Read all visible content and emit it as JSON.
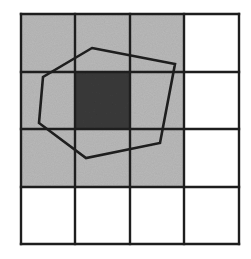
{
  "diagram": {
    "title": "",
    "grid": {
      "rows": 4,
      "cols": 4,
      "x_lines": [
        21,
        75,
        130,
        184,
        239
      ],
      "y_lines": [
        14,
        72,
        129,
        187,
        244
      ],
      "line_color": "#1e1e1e"
    },
    "cells": [
      {
        "row": 0,
        "col": 0,
        "fill": "light-gray"
      },
      {
        "row": 0,
        "col": 1,
        "fill": "light-gray"
      },
      {
        "row": 0,
        "col": 2,
        "fill": "light-gray"
      },
      {
        "row": 0,
        "col": 3,
        "fill": "white"
      },
      {
        "row": 1,
        "col": 0,
        "fill": "light-gray"
      },
      {
        "row": 1,
        "col": 1,
        "fill": "dark-gray"
      },
      {
        "row": 1,
        "col": 2,
        "fill": "light-gray"
      },
      {
        "row": 1,
        "col": 3,
        "fill": "white"
      },
      {
        "row": 2,
        "col": 0,
        "fill": "light-gray"
      },
      {
        "row": 2,
        "col": 1,
        "fill": "light-gray"
      },
      {
        "row": 2,
        "col": 2,
        "fill": "light-gray"
      },
      {
        "row": 2,
        "col": 3,
        "fill": "white"
      },
      {
        "row": 3,
        "col": 0,
        "fill": "white"
      },
      {
        "row": 3,
        "col": 1,
        "fill": "white"
      },
      {
        "row": 3,
        "col": 2,
        "fill": "white"
      },
      {
        "row": 3,
        "col": 3,
        "fill": "white"
      }
    ],
    "colors": {
      "light-gray": "#b9b9b9",
      "dark-gray": "#3a3a3a",
      "white": "#ffffff"
    },
    "polygon": {
      "points": [
        [
          92,
          48
        ],
        [
          175,
          64
        ],
        [
          160,
          143
        ],
        [
          86,
          158
        ],
        [
          39,
          123
        ],
        [
          43,
          77
        ]
      ],
      "stroke": "#1e1e1e"
    }
  }
}
